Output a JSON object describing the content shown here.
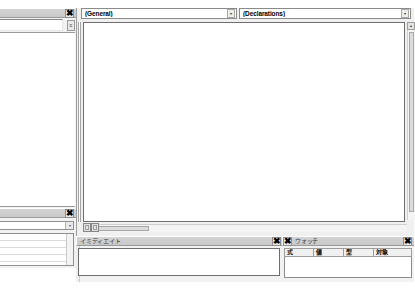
{
  "app": {
    "name": "Microsoft Visual Basic for Applications Editor",
    "chrome_color": "#d3d3d3",
    "code_background": "#ffffff"
  },
  "project_explorer": {
    "title": "",
    "close_label": "✖",
    "scroll_glyph": "≡",
    "tree_items": [
      {
        "label": "1.xlsm)"
      },
      {
        "label": "XLSB)"
      },
      {
        "label": "m)"
      }
    ]
  },
  "properties_window": {
    "title": "",
    "close_label": "✖",
    "object_combo_value": "",
    "combo_arrow": "▾",
    "rows": [
      "",
      "",
      "",
      ""
    ]
  },
  "code_window": {
    "object_dropdown": {
      "value": "(General)",
      "arrow": "▾"
    },
    "procedure_dropdown": {
      "value": "(Declarations)",
      "arrow": "▾"
    },
    "code_text": "",
    "vscroll": {
      "up_arrow": "▴",
      "down_arrow": "▾"
    },
    "view_buttons": {
      "procedure_view": "procedure-view",
      "full_module_view": "full-module-view"
    }
  },
  "immediate_window": {
    "title": "イミディエイト",
    "close_label": "✖",
    "content": ""
  },
  "watch_window": {
    "title": "ウォッチ",
    "close_label": "✖",
    "left_close_label": "✖",
    "columns": [
      {
        "label": "式",
        "width": 30
      },
      {
        "label": "値",
        "width": 30
      },
      {
        "label": "型",
        "width": 30
      },
      {
        "label": "対象",
        "width": 36
      }
    ],
    "rows": []
  }
}
